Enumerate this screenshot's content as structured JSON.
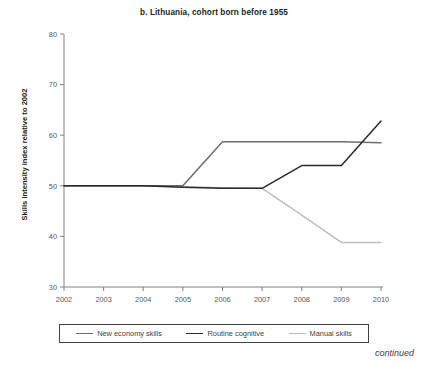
{
  "figure": {
    "title": "b. Lithuania, cohort born before 1955",
    "footer_note": "continued"
  },
  "chart_data": {
    "type": "line",
    "title": "b. Lithuania, cohort born before 1955",
    "xlabel": "",
    "ylabel": "Skills intensity index relative to 2002",
    "x": [
      2002,
      2003,
      2004,
      2005,
      2006,
      2007,
      2008,
      2009,
      2010
    ],
    "xtick_labels": [
      "2002",
      "2003",
      "2004",
      "2005",
      "2006",
      "2007",
      "2008",
      "2009",
      "2010"
    ],
    "ytick_labels": [
      "30",
      "40",
      "50",
      "60",
      "70",
      "80"
    ],
    "yticks": [
      30,
      40,
      50,
      60,
      70,
      80
    ],
    "xlim": [
      2002,
      2010
    ],
    "ylim": [
      30,
      80
    ],
    "grid": false,
    "legend_position": "bottom",
    "series": [
      {
        "name": "New economy skills",
        "color": "#6d6e71",
        "values": [
          50.0,
          50.0,
          50.0,
          50.0,
          58.7,
          58.7,
          58.7,
          58.7,
          58.5
        ]
      },
      {
        "name": "Routine cognitive",
        "color": "#2b2b2b",
        "values": [
          50.0,
          50.0,
          50.0,
          49.7,
          49.5,
          49.5,
          54.0,
          54.0,
          62.8
        ]
      },
      {
        "name": "Manual skills",
        "color": "#bcbec0",
        "values": [
          50.0,
          50.0,
          50.0,
          49.8,
          49.6,
          49.5,
          44.2,
          38.8,
          38.8
        ]
      }
    ]
  },
  "axis": {
    "axis_color": "#808285",
    "ytitle": "Skills intensity index relative to 2002"
  },
  "legend": {
    "items": [
      {
        "label": "New economy skills",
        "color": "#6d6e71"
      },
      {
        "label": "Routine cognitive",
        "color": "#2b2b2b"
      },
      {
        "label": "Manual skills",
        "color": "#bcbec0"
      }
    ]
  }
}
